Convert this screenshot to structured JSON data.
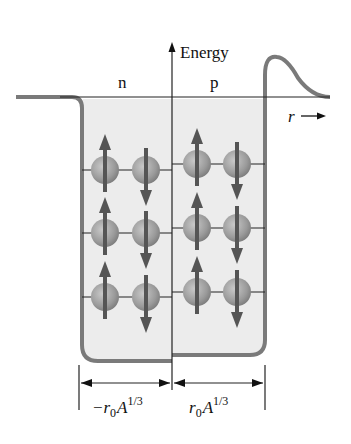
{
  "diagram": {
    "axis_label": "Energy",
    "r_label": "r",
    "neutron_label": "n",
    "proton_label": "p",
    "left_dimension": "−r₀A¹ᐟ³",
    "right_dimension": "r₀A¹ᐟ³",
    "left_dim_parts": {
      "prefix": "−r",
      "sub": "0",
      "base": "A",
      "sup": "1/3"
    },
    "right_dim_parts": {
      "prefix": "r",
      "sub": "0",
      "base": "A",
      "sup": "1/3"
    },
    "neutron_levels": [
      {
        "level": 1,
        "spins": [
          "up",
          "down"
        ]
      },
      {
        "level": 2,
        "spins": [
          "up",
          "down"
        ]
      },
      {
        "level": 3,
        "spins": [
          "up",
          "down"
        ]
      }
    ],
    "proton_levels": [
      {
        "level": 1,
        "spins": [
          "up",
          "down"
        ]
      },
      {
        "level": 2,
        "spins": [
          "up",
          "down"
        ]
      },
      {
        "level": 3,
        "spins": [
          "up",
          "down"
        ]
      }
    ],
    "colors": {
      "well_outline": "#7a7a7a",
      "well_fill": "#ececec",
      "nucleon": "#9a9a9a",
      "spin_arrow": "#555555",
      "line": "#222222"
    }
  }
}
